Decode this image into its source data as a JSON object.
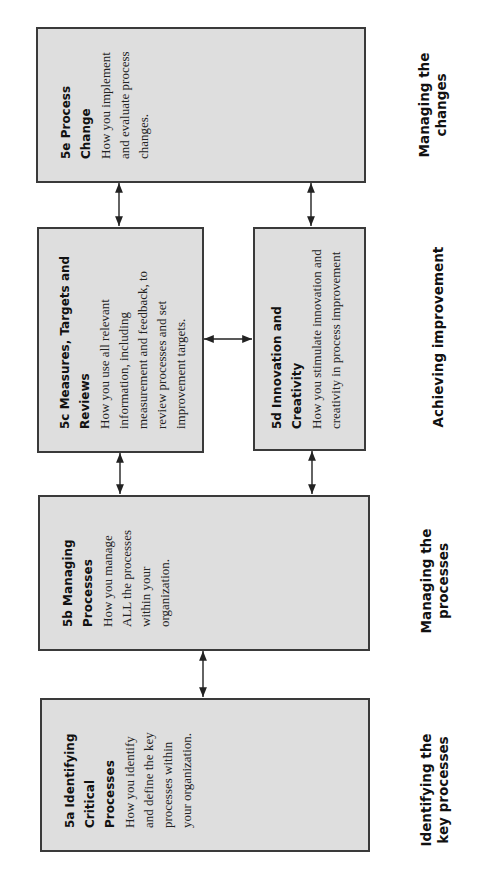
{
  "diagram": {
    "orientation": "rotated-90-ccw",
    "colors": {
      "box_fill": "#dedede",
      "box_border": "#3a3a3a",
      "arrow": "#222222",
      "background": "#ffffff"
    },
    "boxes": [
      {
        "id": "5e",
        "title_lines": [
          "5e  Process",
          "Change"
        ],
        "desc_lines": [
          "How you implement",
          "and evaluate process",
          "changes."
        ]
      },
      {
        "id": "5c",
        "title_lines": [
          "5c  Measures, Targets and",
          "Reviews"
        ],
        "desc_lines": [
          "How you use all relevant",
          "information, including",
          "measurement and feedback, to",
          "review processes and set",
          "improvement targets."
        ]
      },
      {
        "id": "5d",
        "title_lines": [
          "5d  Innovation and",
          "Creativity"
        ],
        "desc_lines": [
          "How you stimulate innovation and",
          "creativity in process improvement"
        ]
      },
      {
        "id": "5b",
        "title_lines": [
          "5b  Managing",
          "Processes"
        ],
        "desc_lines": [
          "How you manage",
          "ALL the processes",
          "within your",
          "organization."
        ]
      },
      {
        "id": "5a",
        "title_lines": [
          "5a  Identifying",
          "Critical",
          "Processes"
        ],
        "desc_lines": [
          "How you identify",
          "and define the key",
          "processes within",
          "your organization."
        ]
      }
    ],
    "stage_labels": [
      {
        "lines": [
          "Managing the",
          "changes"
        ]
      },
      {
        "lines": [
          "Achieving improvement"
        ]
      },
      {
        "lines": [
          "Managing the",
          "processes"
        ]
      },
      {
        "lines": [
          "Identifying the",
          "key processes"
        ]
      }
    ],
    "connections": [
      {
        "from": "5e",
        "to": "5c",
        "type": "bidirectional"
      },
      {
        "from": "5e",
        "to": "5d",
        "type": "bidirectional"
      },
      {
        "from": "5c",
        "to": "5d",
        "type": "bidirectional"
      },
      {
        "from": "5c",
        "to": "5b",
        "type": "bidirectional"
      },
      {
        "from": "5d",
        "to": "5b",
        "type": "bidirectional"
      },
      {
        "from": "5b",
        "to": "5a",
        "type": "bidirectional"
      }
    ]
  }
}
